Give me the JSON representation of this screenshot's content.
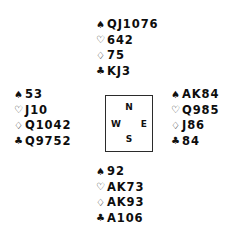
{
  "diagram": {
    "type": "bridge-deal",
    "suit_symbols": {
      "spade": "♠",
      "heart": "♡",
      "diamond": "♢",
      "club": "♣"
    },
    "colors": {
      "ink": "#0d0d0d",
      "box_border": "#2b2b2b",
      "background": "#ffffff"
    },
    "compass": {
      "north": "N",
      "east": "E",
      "south": "S",
      "west": "W"
    },
    "hands": {
      "north": {
        "label": "North",
        "spades": "QJ1076",
        "hearts": "642",
        "diamonds": "75",
        "clubs": "KJ3"
      },
      "west": {
        "label": "West",
        "spades": "53",
        "hearts": "J10",
        "diamonds": "Q1042",
        "clubs": "Q9752"
      },
      "east": {
        "label": "East",
        "spades": "AK84",
        "hearts": "Q985",
        "diamonds": "J86",
        "clubs": "84"
      },
      "south": {
        "label": "South",
        "spades": "92",
        "hearts": "AK73",
        "diamonds": "AK93",
        "clubs": "A106"
      }
    }
  }
}
